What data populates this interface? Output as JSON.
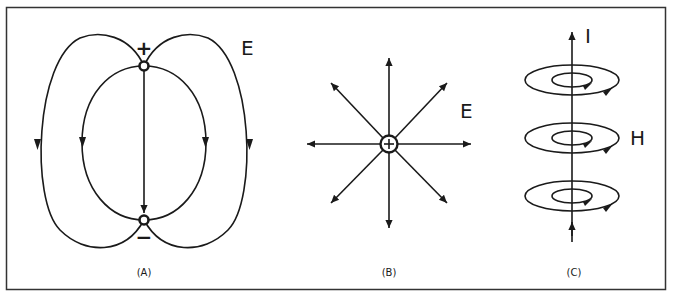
{
  "figure": {
    "panels": [
      {
        "id": "A",
        "caption": "(A)",
        "field_label": "E",
        "description": "Electric field lines between a positive and a negative point charge (dipole)",
        "charges": [
          {
            "sign": "positive",
            "symbol": "+"
          },
          {
            "sign": "negative",
            "symbol": "−"
          }
        ]
      },
      {
        "id": "B",
        "caption": "(B)",
        "field_label": "E",
        "description": "Radial electric field lines pointing outward from a single positive charge",
        "charges": [
          {
            "sign": "positive",
            "symbol": "+"
          }
        ],
        "arrow_count": 8
      },
      {
        "id": "C",
        "caption": "(C)",
        "current_label": "I",
        "field_label": "H",
        "description": "Magnetic field loops circling a straight current-carrying conductor",
        "loop_count": 3
      }
    ],
    "colors": {
      "line": "#1a1a1a",
      "background": "#ffffff",
      "border": "#333333"
    }
  }
}
